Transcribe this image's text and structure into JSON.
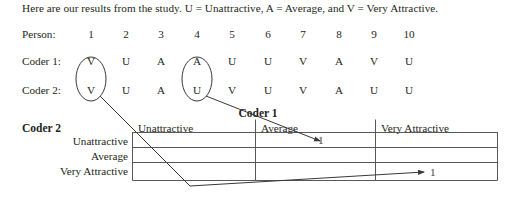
{
  "document": {
    "intro": "Here are our results from the study. U = Unattractive, A = Average, and V = Very Attractive.",
    "legend": {
      "u": "U = Unattractive",
      "a": "A = Average",
      "v": "V = Very Attractive"
    }
  },
  "ratings": {
    "person_label": "Person:",
    "coder1_label": "Coder 1:",
    "coder2_label": "Coder 2:",
    "persons": [
      "1",
      "2",
      "3",
      "4",
      "5",
      "6",
      "7",
      "8",
      "9",
      "10"
    ],
    "coder1": [
      "V",
      "U",
      "A",
      "A",
      "U",
      "U",
      "V",
      "A",
      "V",
      "U"
    ],
    "coder2": [
      "V",
      "U",
      "A",
      "U",
      "V",
      "U",
      "V",
      "A",
      "U",
      "U"
    ],
    "circled_persons": [
      "1",
      "4"
    ]
  },
  "matrix": {
    "column_axis_title": "Coder 1",
    "row_axis_title": "Coder 2",
    "column_headers": [
      "Unattractive",
      "Average",
      "Very Attractive"
    ],
    "row_headers": [
      "Unattractive",
      "Average",
      "Very Attractive"
    ],
    "cells": [
      [
        "",
        "1",
        ""
      ],
      [
        "",
        "",
        ""
      ],
      [
        "",
        "",
        "1"
      ]
    ]
  },
  "colors": {
    "ink": "#231f20",
    "rule": "#58585a",
    "page": "#ffffff"
  }
}
